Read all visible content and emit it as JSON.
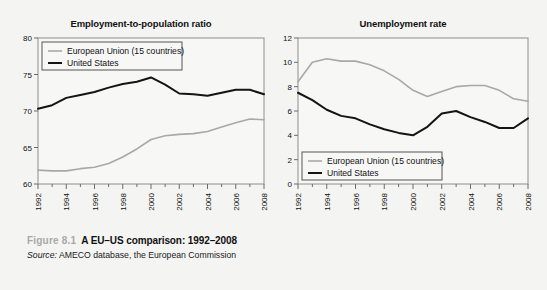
{
  "figure": {
    "caption_number": "Figure 8.1",
    "caption_title": "A EU–US comparison: 1992–2008",
    "source_label": "Source:",
    "source_text": " AMECO database, the European Commission",
    "background_color": "#f4f4f3"
  },
  "series_colors": {
    "eu": "#a8a8a8",
    "us": "#141414",
    "axis": "#6b6b6b",
    "frame": "#8e8e8e"
  },
  "legend": {
    "eu_label": "European Union (15 countries)",
    "us_label": "United States"
  },
  "chart_data": [
    {
      "type": "line",
      "id": "employment-to-population-ratio",
      "title": "Employment-to-population ratio",
      "xlabel": "",
      "ylabel": "",
      "xlim": [
        1992,
        2008
      ],
      "ylim": [
        60,
        80
      ],
      "yticks": [
        60,
        65,
        70,
        75,
        80
      ],
      "xticks": [
        1992,
        1993,
        1994,
        1995,
        1996,
        1997,
        1998,
        1999,
        2000,
        2001,
        2002,
        2003,
        2004,
        2005,
        2006,
        2007,
        2008
      ],
      "xtick_labels_shown": [
        1992,
        1994,
        1996,
        1998,
        2000,
        2002,
        2004,
        2006,
        2008
      ],
      "grid": false,
      "legend_position": "top-left",
      "x": [
        1992,
        1993,
        1994,
        1995,
        1996,
        1997,
        1998,
        1999,
        2000,
        2001,
        2002,
        2003,
        2004,
        2005,
        2006,
        2007,
        2008
      ],
      "series": [
        {
          "name": "European Union (15 countries)",
          "color": "#a8a8a8",
          "values": [
            61.9,
            61.8,
            61.8,
            62.1,
            62.3,
            62.8,
            63.7,
            64.8,
            66.1,
            66.6,
            66.8,
            66.9,
            67.2,
            67.8,
            68.4,
            68.9,
            68.8
          ]
        },
        {
          "name": "United States",
          "color": "#141414",
          "values": [
            70.3,
            70.8,
            71.8,
            72.2,
            72.6,
            73.2,
            73.7,
            74.0,
            74.6,
            73.6,
            72.4,
            72.3,
            72.1,
            72.5,
            72.9,
            72.9,
            72.3
          ]
        }
      ]
    },
    {
      "type": "line",
      "id": "unemployment-rate",
      "title": "Unemployment rate",
      "xlabel": "",
      "ylabel": "",
      "xlim": [
        1992,
        2008
      ],
      "ylim": [
        0,
        12
      ],
      "yticks": [
        0,
        2,
        4,
        6,
        8,
        10,
        12
      ],
      "xticks": [
        1992,
        1993,
        1994,
        1995,
        1996,
        1997,
        1998,
        1999,
        2000,
        2001,
        2002,
        2003,
        2004,
        2005,
        2006,
        2007,
        2008
      ],
      "xtick_labels_shown": [
        1992,
        1994,
        1996,
        1998,
        2000,
        2002,
        2004,
        2006,
        2008
      ],
      "grid": false,
      "legend_position": "bottom-left",
      "x": [
        1992,
        1993,
        1994,
        1995,
        1996,
        1997,
        1998,
        1999,
        2000,
        2001,
        2002,
        2003,
        2004,
        2005,
        2006,
        2007,
        2008
      ],
      "series": [
        {
          "name": "European Union (15 countries)",
          "color": "#a8a8a8",
          "values": [
            8.4,
            10.0,
            10.3,
            10.1,
            10.1,
            9.8,
            9.3,
            8.6,
            7.7,
            7.2,
            7.6,
            8.0,
            8.1,
            8.1,
            7.7,
            7.0,
            6.8
          ]
        },
        {
          "name": "United States",
          "color": "#141414",
          "values": [
            7.5,
            6.9,
            6.1,
            5.6,
            5.4,
            4.9,
            4.5,
            4.2,
            4.0,
            4.7,
            5.8,
            6.0,
            5.5,
            5.1,
            4.6,
            4.6,
            5.4
          ]
        }
      ]
    }
  ]
}
